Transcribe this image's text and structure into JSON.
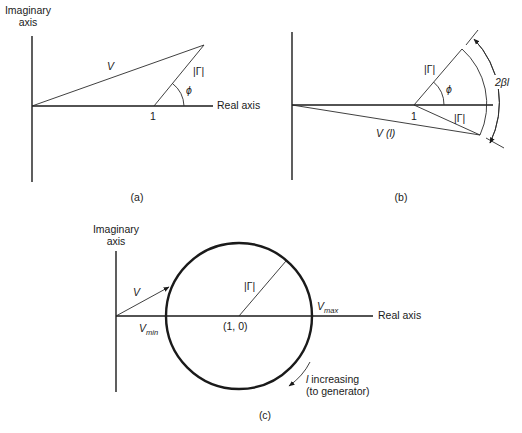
{
  "figure": {
    "panel_a": {
      "caption": "(a)",
      "imag_axis_label_line1": "Imaginary",
      "imag_axis_label_line2": "axis",
      "real_axis_label": "Real axis",
      "vector_label": "V",
      "gamma_label": "|Γ|",
      "angle_label": "ϕ",
      "point_label": "1"
    },
    "panel_b": {
      "caption": "(b)",
      "gamma_upper_label": "|Γ|",
      "gamma_lower_label": "|Γ|",
      "angle_label": "ϕ",
      "point_label": "1",
      "vector_label": "V (l)",
      "rotation_label": "2βl"
    },
    "panel_c": {
      "caption": "(c)",
      "imag_axis_label_line1": "Imaginary",
      "imag_axis_label_line2": "axis",
      "real_axis_label": "Real axis",
      "vector_label": "V",
      "gamma_label": "|Γ|",
      "center_label": "(1, 0)",
      "vmax_label": "V",
      "vmax_sub": "max",
      "vmin_label": "V",
      "vmin_sub": "min",
      "direction_line1_var": "l",
      "direction_line1": " increasing",
      "direction_line2": "(to generator)"
    },
    "colors": {
      "ink": "#1a1a1a",
      "background": "#ffffff"
    }
  }
}
